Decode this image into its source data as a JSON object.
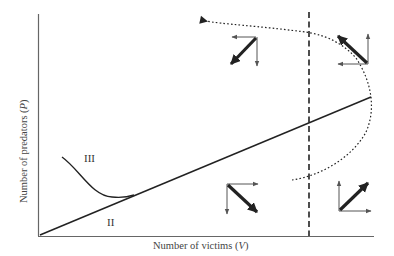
{
  "diagram": {
    "type": "predator-prey phase plane",
    "x_axis_label": "Number of victims (V)",
    "y_axis_label": "Number of predators (P)",
    "x_axis_label_main": "Number of victims (",
    "x_axis_label_var": "V",
    "x_axis_label_end": ")",
    "y_axis_label_main": "Number of predators (",
    "y_axis_label_var": "P",
    "y_axis_label_end": ")",
    "region_labels": [
      "III",
      "II"
    ],
    "elements": {
      "predator_isocline": "diagonal solid line from origin",
      "victim_isocline": "vertical dashed line",
      "trajectory": "dotted curved trajectory with arrowhead pointing left",
      "curve_III": "solid curve joining diagonal line"
    },
    "vector_quadrants": [
      {
        "position": "upper-left",
        "arrows": [
          "left",
          "down"
        ],
        "resultant": "down-left"
      },
      {
        "position": "upper-right",
        "arrows": [
          "left",
          "up"
        ],
        "resultant": "up-left"
      },
      {
        "position": "lower-left",
        "arrows": [
          "right",
          "down"
        ],
        "resultant": "down-right"
      },
      {
        "position": "lower-right",
        "arrows": [
          "right",
          "up"
        ],
        "resultant": "up-right"
      }
    ],
    "colors": {
      "axis": "#555555",
      "line": "#222222",
      "thin_arrow": "#555555",
      "thick_arrow": "#222222"
    }
  }
}
